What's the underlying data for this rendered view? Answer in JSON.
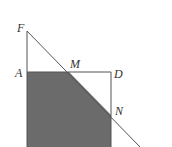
{
  "diagram": {
    "labels": {
      "F": "F",
      "A": "A",
      "M": "M",
      "D": "D",
      "N": "N"
    },
    "colors": {
      "shade": "#6b6b6b",
      "line": "#555555",
      "background": "#ffffff"
    }
  }
}
